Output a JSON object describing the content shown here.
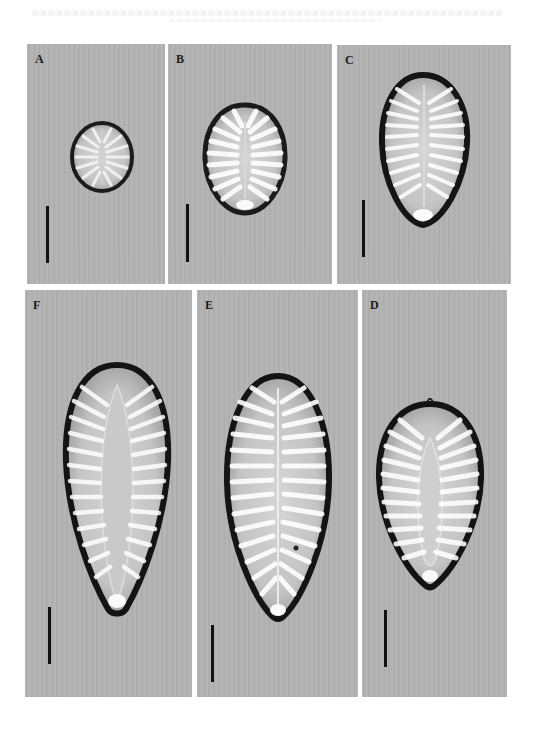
{
  "figure": {
    "type": "micrograph-plate",
    "background_color": "#b3b3b3",
    "panels": [
      {
        "id": "A",
        "label": "A",
        "shape": "elliptic-round",
        "scale_bar": true
      },
      {
        "id": "B",
        "label": "B",
        "shape": "ovate",
        "scale_bar": true
      },
      {
        "id": "C",
        "label": "C",
        "shape": "obovate",
        "scale_bar": true
      },
      {
        "id": "F",
        "label": "F",
        "shape": "clavate",
        "scale_bar": true
      },
      {
        "id": "E",
        "label": "E",
        "shape": "clavate-obovate",
        "scale_bar": true
      },
      {
        "id": "D",
        "label": "D",
        "shape": "ovate-cuneate",
        "scale_bar": true
      }
    ]
  },
  "labels": {
    "A": "A",
    "B": "B",
    "C": "C",
    "D": "D",
    "E": "E",
    "F": "F"
  }
}
